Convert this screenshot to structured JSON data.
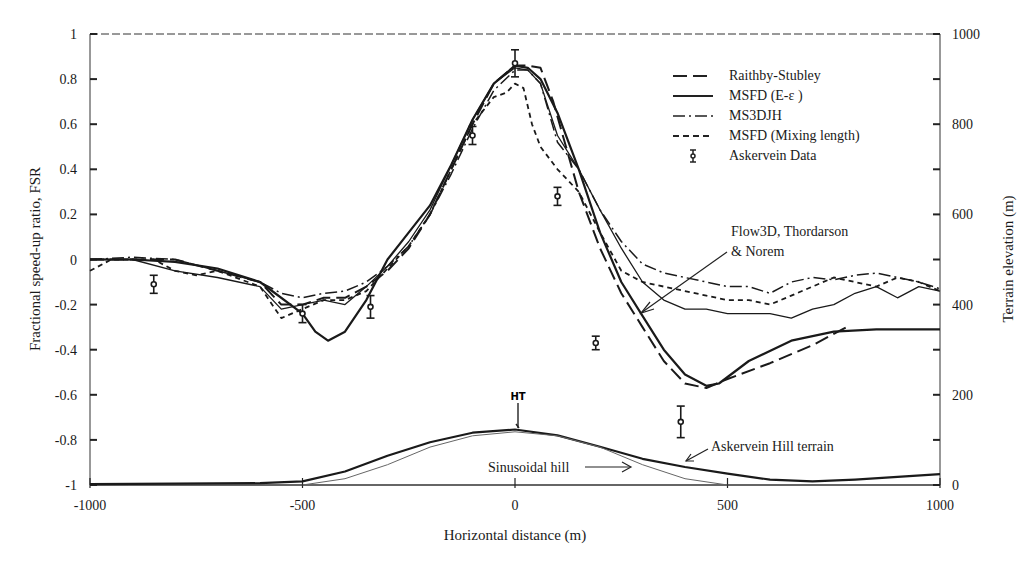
{
  "chart_data": {
    "type": "line",
    "title": "",
    "xlabel": "Horizontal distance (m)",
    "ylabel": "Fractional speed-up ratio, FSR",
    "y2label": "Terrain elevation (m)",
    "xlim": [
      -1000,
      1000
    ],
    "ylim": [
      -1,
      1
    ],
    "y2lim": [
      0,
      1000
    ],
    "x_ticks": [
      "-1000",
      "-500",
      "0",
      "500",
      "1000"
    ],
    "y_ticks": [
      "1",
      "0.8",
      "0.6",
      "0.4",
      "0.2",
      "0",
      "-0.2",
      "-0.4",
      "-0.6",
      "-0.8",
      "-1"
    ],
    "y2_ticks": [
      "1000",
      "800",
      "600",
      "400",
      "200",
      "0"
    ],
    "grid": false,
    "legend_position": "upper right",
    "legend": [
      {
        "label": "Raithby-Stubley",
        "style": "long-dash"
      },
      {
        "label": "MSFD (E-ε )",
        "style": "solid"
      },
      {
        "label": "MS3DJH",
        "style": "dash-dot"
      },
      {
        "label": "MSFD (Mixing length)",
        "style": "short-dash"
      },
      {
        "label": "Askervein Data",
        "style": "error-bar-marker"
      }
    ],
    "series": [
      {
        "name": "Flow3D, Thordarson & Norem",
        "style": "solid-thick",
        "x": [
          -1000,
          -900,
          -800,
          -700,
          -600,
          -500,
          -470,
          -440,
          -400,
          -350,
          -300,
          -250,
          -200,
          -150,
          -100,
          -50,
          0,
          30,
          60,
          100,
          150,
          200,
          250,
          300,
          350,
          400,
          450,
          480,
          550,
          650,
          750,
          850,
          1000
        ],
        "y": [
          0.0,
          0.0,
          -0.01,
          -0.04,
          -0.1,
          -0.24,
          -0.32,
          -0.36,
          -0.32,
          -0.18,
          0.0,
          0.12,
          0.24,
          0.42,
          0.62,
          0.78,
          0.86,
          0.85,
          0.8,
          0.65,
          0.4,
          0.12,
          -0.1,
          -0.25,
          -0.4,
          -0.51,
          -0.56,
          -0.55,
          -0.45,
          -0.36,
          -0.32,
          -0.31,
          -0.31
        ]
      },
      {
        "name": "Raithby-Stubley",
        "style": "long-dash",
        "x": [
          -1000,
          -900,
          -800,
          -700,
          -600,
          -550,
          -500,
          -450,
          -400,
          -350,
          -300,
          -250,
          -200,
          -150,
          -100,
          -50,
          0,
          30,
          60,
          90,
          120,
          150,
          200,
          250,
          300,
          350,
          400,
          450,
          500,
          600,
          700,
          780
        ],
        "y": [
          0.0,
          0.0,
          0.0,
          -0.05,
          -0.1,
          -0.2,
          -0.2,
          -0.17,
          -0.17,
          -0.12,
          -0.05,
          0.05,
          0.2,
          0.4,
          0.6,
          0.78,
          0.86,
          0.86,
          0.85,
          0.7,
          0.5,
          0.3,
          0.05,
          -0.15,
          -0.3,
          -0.45,
          -0.55,
          -0.57,
          -0.53,
          -0.46,
          -0.38,
          -0.3
        ]
      },
      {
        "name": "MSFD (E-ε )",
        "style": "solid",
        "x": [
          -1000,
          -900,
          -800,
          -700,
          -600,
          -550,
          -500,
          -450,
          -400,
          -350,
          -300,
          -250,
          -200,
          -150,
          -100,
          -50,
          0,
          30,
          60,
          100,
          150,
          200,
          250,
          300,
          350,
          400,
          450,
          500,
          550,
          600,
          650,
          700,
          750,
          800,
          850,
          900,
          950,
          1000
        ],
        "y": [
          0.0,
          0.0,
          -0.05,
          -0.08,
          -0.12,
          -0.22,
          -0.2,
          -0.18,
          -0.2,
          -0.12,
          -0.03,
          0.08,
          0.22,
          0.42,
          0.62,
          0.78,
          0.85,
          0.84,
          0.78,
          0.55,
          0.4,
          0.22,
          0.05,
          -0.1,
          -0.18,
          -0.22,
          -0.22,
          -0.24,
          -0.24,
          -0.24,
          -0.26,
          -0.22,
          -0.2,
          -0.15,
          -0.12,
          -0.17,
          -0.12,
          -0.14
        ]
      },
      {
        "name": "MS3DJH",
        "style": "dash-dot",
        "x": [
          -1000,
          -900,
          -800,
          -700,
          -600,
          -550,
          -500,
          -450,
          -400,
          -350,
          -300,
          -250,
          -200,
          -150,
          -100,
          -50,
          0,
          30,
          60,
          100,
          150,
          200,
          250,
          300,
          350,
          400,
          450,
          500,
          550,
          600,
          650,
          700,
          750,
          800,
          850,
          900,
          950,
          1000
        ],
        "y": [
          0.0,
          0.01,
          0.0,
          -0.05,
          -0.1,
          -0.15,
          -0.17,
          -0.15,
          -0.14,
          -0.1,
          -0.03,
          0.06,
          0.2,
          0.38,
          0.58,
          0.75,
          0.84,
          0.84,
          0.78,
          0.52,
          0.4,
          0.22,
          0.08,
          -0.02,
          -0.06,
          -0.08,
          -0.1,
          -0.12,
          -0.12,
          -0.15,
          -0.1,
          -0.08,
          -0.09,
          -0.07,
          -0.06,
          -0.08,
          -0.1,
          -0.13
        ]
      },
      {
        "name": "MSFD (Mixing length)",
        "style": "short-dash",
        "x": [
          -1000,
          -950,
          -900,
          -850,
          -800,
          -750,
          -700,
          -600,
          -550,
          -500,
          -450,
          -400,
          -350,
          -300,
          -250,
          -200,
          -150,
          -100,
          -50,
          -20,
          0,
          20,
          40,
          60,
          100,
          150,
          200,
          250,
          300,
          350,
          400,
          450,
          500,
          550,
          600,
          650,
          700,
          750,
          800,
          850,
          900,
          950,
          1000
        ],
        "y": [
          -0.05,
          0.0,
          0.0,
          0.0,
          -0.05,
          -0.07,
          -0.05,
          -0.12,
          -0.26,
          -0.22,
          -0.18,
          -0.18,
          -0.14,
          -0.04,
          0.06,
          0.2,
          0.4,
          0.6,
          0.72,
          0.74,
          0.78,
          0.76,
          0.6,
          0.5,
          0.4,
          0.3,
          0.12,
          -0.05,
          -0.1,
          -0.12,
          -0.14,
          -0.16,
          -0.18,
          -0.18,
          -0.2,
          -0.16,
          -0.12,
          -0.08,
          -0.1,
          -0.12,
          -0.08,
          -0.1,
          -0.14
        ]
      },
      {
        "name": "Askervein Data",
        "style": "error-bar-marker",
        "x": [
          -850,
          -500,
          -340,
          -100,
          0,
          100,
          190,
          390
        ],
        "y": [
          -0.11,
          -0.24,
          -0.21,
          0.55,
          0.87,
          0.28,
          -0.37,
          -0.72
        ],
        "err": [
          0.04,
          0.04,
          0.05,
          0.04,
          0.06,
          0.04,
          0.03,
          0.07
        ]
      },
      {
        "name": "Askervein Hill terrain",
        "axis": "right",
        "style": "solid-thick",
        "x": [
          -1000,
          -800,
          -600,
          -500,
          -400,
          -300,
          -200,
          -100,
          0,
          100,
          200,
          300,
          400,
          500,
          600,
          700,
          800,
          900,
          1000
        ],
        "y": [
          2,
          3,
          4,
          8,
          30,
          65,
          95,
          116,
          123,
          110,
          85,
          58,
          40,
          25,
          12,
          8,
          12,
          18,
          24
        ]
      },
      {
        "name": "Sinusoidal hill",
        "axis": "right",
        "style": "solid-thin",
        "x": [
          -500,
          -400,
          -300,
          -200,
          -100,
          0,
          100,
          200,
          300,
          400,
          500
        ],
        "y": [
          0,
          14,
          45,
          84,
          109,
          118,
          109,
          84,
          45,
          14,
          0
        ]
      }
    ],
    "annotations": [
      {
        "text": "Flow3D, Thordarson",
        "line2": "& Norem",
        "x": 470,
        "y": 0.08
      },
      {
        "text": "Askervein Hill terrain",
        "x": 470,
        "y2": 95
      },
      {
        "text": "Sinusoidal hill",
        "x": 60,
        "y2": 40
      },
      {
        "text": "HT",
        "x": 5,
        "y2": 195
      }
    ]
  }
}
